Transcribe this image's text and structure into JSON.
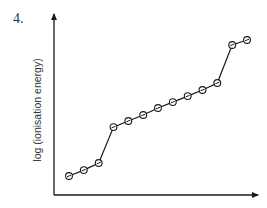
{
  "question": {
    "number": "4."
  },
  "chart_data": {
    "type": "line",
    "title": "",
    "xlabel": "",
    "ylabel": "log (ionisation energy)",
    "x": [
      1,
      2,
      3,
      4,
      5,
      6,
      7,
      8,
      9,
      10,
      11,
      12,
      13
    ],
    "series": [
      {
        "name": "successive ionisation energies",
        "values": [
          1.0,
          1.33,
          1.72,
          3.72,
          4.06,
          4.39,
          4.78,
          5.11,
          5.44,
          5.78,
          6.17,
          8.28,
          8.56
        ]
      }
    ],
    "marker": "circle-with-dot",
    "grid": false,
    "legend": null,
    "axis_ticks": false
  },
  "colors": {
    "line": "#1a1a1a",
    "axis": "#1a1a1a",
    "text": "#333333",
    "background": "#ffffff"
  }
}
